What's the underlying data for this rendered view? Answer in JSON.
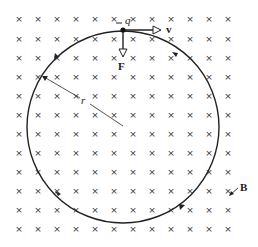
{
  "diagram": {
    "field": {
      "symbol": "×",
      "direction": "into-page",
      "label": "B",
      "color": "#333333",
      "grid": {
        "cols": [
          19,
          38,
          57,
          76,
          95,
          114,
          133,
          152,
          171,
          190,
          209,
          228
        ],
        "rows": [
          19,
          39,
          58,
          77,
          96,
          115,
          134,
          153,
          172,
          191,
          210,
          229
        ]
      }
    },
    "orbit": {
      "cx": 123,
      "cy": 127,
      "r": 96,
      "color": "#222222",
      "direction": "clockwise"
    },
    "charge": {
      "label": "−q",
      "sign": "-",
      "symbol": "q",
      "x": 123,
      "y": 30
    },
    "velocity": {
      "label": "v"
    },
    "force": {
      "label": "F"
    },
    "radius": {
      "label": "r"
    }
  }
}
